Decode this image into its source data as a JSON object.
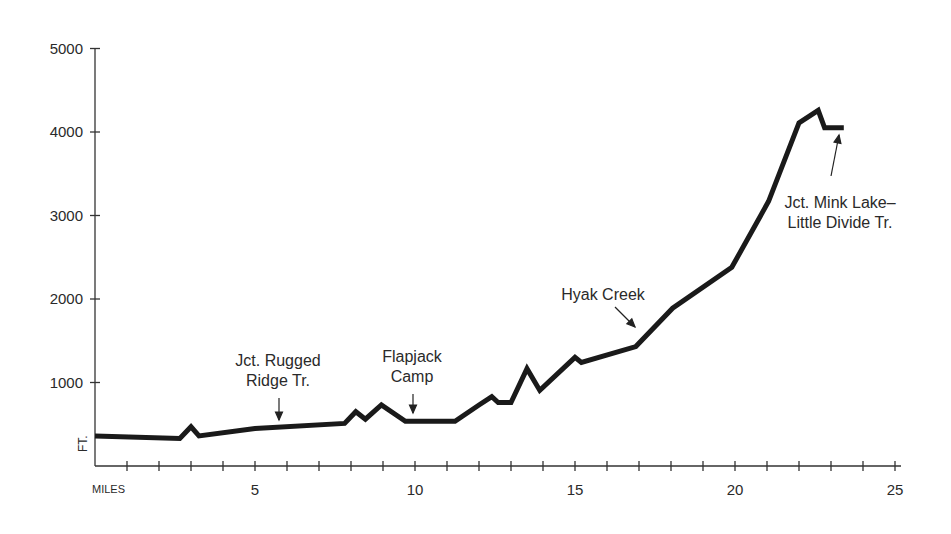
{
  "chart_data": {
    "type": "line",
    "title": "",
    "xlabel": "MILES",
    "ylabel": "FT.",
    "xlim": [
      0,
      25
    ],
    "ylim": [
      0,
      5000
    ],
    "grid": false,
    "x_ticks": [
      5,
      10,
      15,
      20,
      25
    ],
    "x_minor_tick_step": 1,
    "y_ticks": [
      1000,
      2000,
      3000,
      4000,
      5000
    ],
    "series": [
      {
        "name": "Elevation profile",
        "x": [
          0,
          2.65,
          3.0,
          3.25,
          5.0,
          7.8,
          8.15,
          8.45,
          8.95,
          9.7,
          11.25,
          12.0,
          12.4,
          12.6,
          13.0,
          13.5,
          13.9,
          15.0,
          15.2,
          16.9,
          18.05,
          19.9,
          21.05,
          22.0,
          22.6,
          22.8,
          23.4
        ],
        "values": [
          360,
          330,
          470,
          360,
          450,
          510,
          650,
          560,
          730,
          535,
          535,
          730,
          830,
          760,
          760,
          1165,
          905,
          1300,
          1240,
          1430,
          1890,
          2380,
          3170,
          4110,
          4260,
          4050,
          4050
        ]
      }
    ],
    "annotations": [
      {
        "text": "Jct. Rugged\nRidge Tr.",
        "x": 5.7,
        "y": 460
      },
      {
        "text": "Flapjack\nCamp",
        "x": 9.9,
        "y": 535
      },
      {
        "text": "Hyak Creek",
        "x": 16.9,
        "y": 1430
      },
      {
        "text": "Jct. Mink Lake–\nLittle Divide Tr.",
        "x": 23.2,
        "y": 4050
      }
    ]
  },
  "axes": {
    "y_labels": [
      "5000",
      "4000",
      "3000",
      "2000",
      "1000"
    ],
    "x_labels": [
      "5",
      "10",
      "15",
      "20",
      "25"
    ],
    "x_title": "MILES",
    "y_title": "FT."
  },
  "annotations": {
    "rugged_ridge": "Jct. Rugged\nRidge Tr.",
    "flapjack": "Flapjack\nCamp",
    "hyak": "Hyak Creek",
    "mink_lake": "Jct. Mink Lake–\nLittle Divide Tr."
  },
  "colors": {
    "line": "#1a1a1a",
    "axis": "#333333"
  }
}
